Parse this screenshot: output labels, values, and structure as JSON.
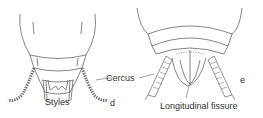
{
  "figure": {
    "labels": {
      "cercus": "Cercus",
      "styles": "Styles",
      "panel_d": "d",
      "panel_e": "e",
      "longitudinal_fissure": "Longitudinal fissure"
    },
    "colors": {
      "line": "#555555",
      "text": "#333333",
      "background": "#ffffff"
    }
  }
}
